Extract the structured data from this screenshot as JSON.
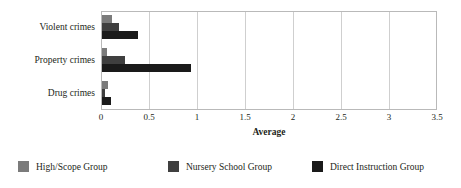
{
  "chart_data": {
    "type": "bar",
    "orientation": "horizontal",
    "title": "",
    "xlabel": "Average",
    "ylabel": "",
    "xlim": [
      0,
      3.5
    ],
    "xticks": [
      "0",
      "0.5",
      "1",
      "1.5",
      "2",
      "2.5",
      "3",
      "3.5"
    ],
    "xtick_values": [
      0,
      0.5,
      1,
      1.5,
      2,
      2.5,
      3,
      3.5
    ],
    "grid": "vertical",
    "legend_position": "bottom",
    "categories": [
      "Violent crimes",
      "Property crimes",
      "Drug crimes"
    ],
    "series": [
      {
        "name": "High/Scope Group",
        "color": "#7b7b7b",
        "values": [
          0.1,
          0.05,
          0.06
        ]
      },
      {
        "name": "Nursery School Group",
        "color": "#3f3f3f",
        "values": [
          0.18,
          0.24,
          0.03
        ]
      },
      {
        "name": "Direct Instruction Group",
        "color": "#1a1a1a",
        "values": [
          0.38,
          0.93,
          0.09
        ]
      }
    ]
  },
  "axis": {
    "x_title": "Average",
    "tick_0": "0",
    "tick_1": "0.5",
    "tick_2": "1",
    "tick_3": "1.5",
    "tick_4": "2",
    "tick_5": "2.5",
    "tick_6": "3",
    "tick_7": "3.5"
  },
  "categories": {
    "violent": "Violent crimes",
    "property": "Property crimes",
    "drug": "Drug crimes"
  },
  "legend": {
    "items": [
      {
        "label": "High/Scope Group",
        "color": "#7b7b7b"
      },
      {
        "label": "Nursery School Group",
        "color": "#3f3f3f"
      },
      {
        "label": "Direct Instruction Group",
        "color": "#1a1a1a"
      }
    ]
  }
}
